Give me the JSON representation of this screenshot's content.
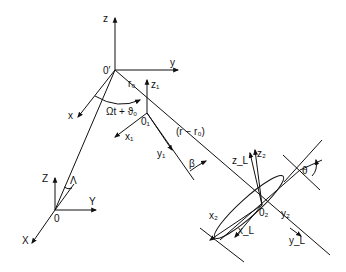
{
  "diagram": {
    "origins": {
      "O": "0",
      "O_prime": "0′",
      "O1": "0₁",
      "O2": "0₂"
    },
    "axes": {
      "ground": {
        "X": "X",
        "Y": "Y",
        "Z": "Z"
      },
      "primed": {
        "x": "x",
        "y": "y",
        "z": "z"
      },
      "frame1": {
        "x1": "x₁",
        "y1": "y₁",
        "z1": "z₁"
      },
      "frame2": {
        "x2": "x₂",
        "y2": "y₂",
        "z2": "z₂"
      },
      "local": {
        "xL": "x_L",
        "yL": "y_L",
        "zL": "z_L"
      }
    },
    "annotations": {
      "r0": "r₀",
      "angle_rotation": "Ωt + ϑ₀",
      "distance": "(r − r₀)",
      "beta": "β",
      "theta": "θ",
      "lambda": "Λ"
    },
    "colors": {
      "ink": "#111111",
      "background": "#ffffff"
    }
  }
}
